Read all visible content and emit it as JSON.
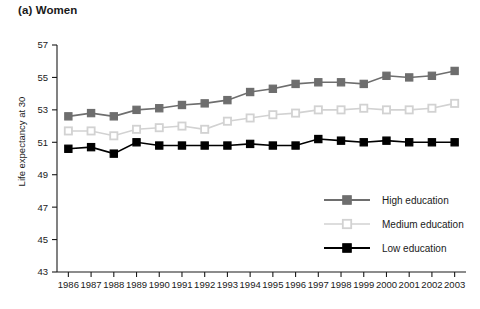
{
  "figure": {
    "panel_title": "(a) Women",
    "ylabel": "Life expectancy at 30"
  },
  "colors": {
    "high": "#6e6e6e",
    "medium": "#d2d2d2",
    "low": "#000000",
    "axis": "#1a1a1a",
    "background": "#ffffff"
  },
  "legend": {
    "position": "inside-bottom-right",
    "items": [
      {
        "label": "High education",
        "color": "#6e6e6e",
        "marker": "filled-square"
      },
      {
        "label": "Medium education",
        "color": "#d2d2d2",
        "marker": "open-square"
      },
      {
        "label": "Low education",
        "color": "#000000",
        "marker": "filled-square"
      }
    ]
  },
  "chart_data": {
    "type": "line",
    "title": "(a) Women",
    "xlabel": "",
    "ylabel": "Life expectancy at 30",
    "ylim": [
      43,
      57
    ],
    "yticks": [
      43,
      45,
      47,
      49,
      51,
      53,
      55,
      57
    ],
    "grid": false,
    "categories": [
      "1986",
      "1987",
      "1988",
      "1989",
      "1990",
      "1991",
      "1992",
      "1993",
      "1994",
      "1995",
      "1996",
      "1997",
      "1998",
      "1999",
      "2000",
      "2001",
      "2002",
      "2003"
    ],
    "series": [
      {
        "name": "High education",
        "color": "#6e6e6e",
        "values": [
          52.6,
          52.8,
          52.6,
          53.0,
          53.1,
          53.3,
          53.4,
          53.6,
          54.1,
          54.3,
          54.6,
          54.7,
          54.7,
          54.6,
          55.1,
          55.0,
          55.1,
          55.4
        ]
      },
      {
        "name": "Medium education",
        "color": "#d2d2d2",
        "values": [
          51.7,
          51.7,
          51.4,
          51.8,
          51.9,
          52.0,
          51.8,
          52.3,
          52.5,
          52.7,
          52.8,
          53.0,
          53.0,
          53.1,
          53.0,
          53.0,
          53.1,
          53.4
        ]
      },
      {
        "name": "Low education",
        "color": "#000000",
        "values": [
          50.6,
          50.7,
          50.3,
          51.0,
          50.8,
          50.8,
          50.8,
          50.8,
          50.9,
          50.8,
          50.8,
          51.2,
          51.1,
          51.0,
          51.1,
          51.0,
          51.0,
          51.0
        ]
      }
    ]
  }
}
